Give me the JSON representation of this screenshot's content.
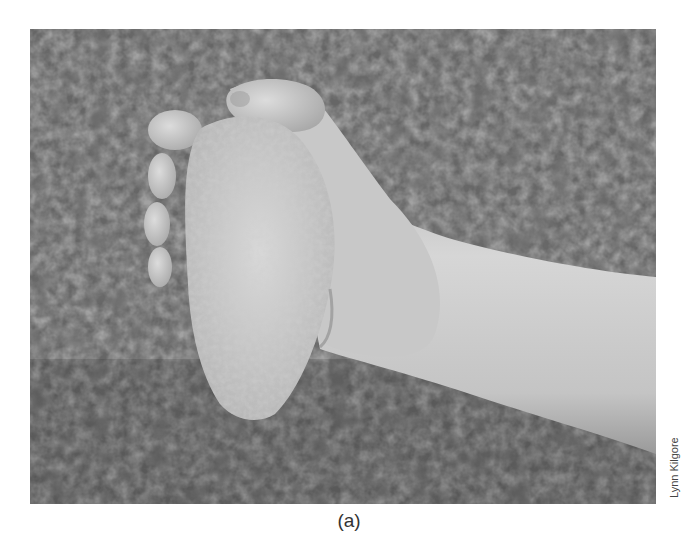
{
  "figure": {
    "caption": "(a)",
    "credit": "Lynn Kilgore",
    "photo": {
      "subject": "hand holding a stone handaxe over grass",
      "tone": "grayscale",
      "colors": {
        "grass_dark": "#3a3a3a",
        "grass_mid": "#6e6e6e",
        "skin": "#c9c9c9",
        "stone": "#d2d2d2",
        "border_bg": "#ffffff"
      }
    }
  }
}
